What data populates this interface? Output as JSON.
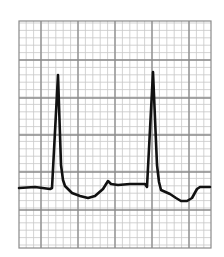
{
  "chart_data": {
    "type": "line",
    "title": "",
    "xlabel": "",
    "ylabel": "",
    "description": "ECG rhythm strip on grid paper showing two QRS complexes",
    "grid": {
      "on": true,
      "minor_per_major": 5,
      "major_color": "#8a8a8a",
      "minor_color": "#c8c8c8",
      "frame": {
        "x0": 19,
        "y0": 21,
        "x1": 211,
        "y1": 248
      },
      "major_x": [
        41,
        78,
        115,
        152,
        189
      ],
      "major_y": [
        60,
        98,
        135,
        172,
        210
      ],
      "minor_spacing_px": 7.4
    },
    "series": [
      {
        "name": "ECG trace",
        "color": "#111111",
        "stroke_width": 2.6,
        "points": [
          [
            19,
            188
          ],
          [
            35,
            187
          ],
          [
            50,
            189
          ],
          [
            52,
            188
          ],
          [
            58,
            75
          ],
          [
            61,
            165
          ],
          [
            63,
            180
          ],
          [
            65,
            186
          ],
          [
            72,
            193
          ],
          [
            80,
            196
          ],
          [
            88,
            198
          ],
          [
            95,
            196
          ],
          [
            103,
            189
          ],
          [
            108,
            181
          ],
          [
            111,
            184
          ],
          [
            118,
            185
          ],
          [
            130,
            184
          ],
          [
            145,
            184
          ],
          [
            147,
            187
          ],
          [
            153,
            72
          ],
          [
            157,
            165
          ],
          [
            159,
            182
          ],
          [
            161,
            190
          ],
          [
            170,
            194
          ],
          [
            176,
            198
          ],
          [
            181,
            201
          ],
          [
            187,
            201
          ],
          [
            192,
            198
          ],
          [
            197,
            189
          ],
          [
            200,
            187
          ],
          [
            210,
            187
          ]
        ]
      }
    ],
    "annotations": [
      {
        "label": "R peak 1",
        "x": 58,
        "y": 75
      },
      {
        "label": "R peak 2",
        "x": 153,
        "y": 72
      }
    ],
    "legend": null
  }
}
